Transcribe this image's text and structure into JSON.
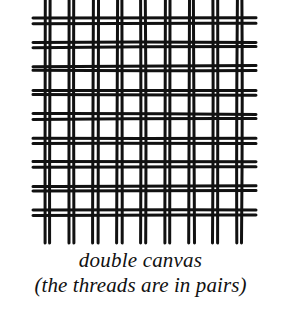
{
  "figure": {
    "name": "double-canvas-weave",
    "alt_description": "Line drawing of a plain-weave canvas in which both warp and weft threads run in pairs",
    "background_color": "#ffffff",
    "thread_color": "#111111",
    "weave": {
      "type": "plain-weave",
      "thread_grouping": "pairs",
      "warp_pair_count": 9,
      "weft_pair_count": 9,
      "pair_gap_px": 2,
      "stroke_width_px": 3,
      "pair_pitch_px": 24,
      "grid_left_px": 45,
      "grid_top_px": 18,
      "grid_right_px": 248,
      "grid_bottom_px": 224,
      "warp_overhang_top_px": 18,
      "warp_overhang_bottom_px": 19,
      "weft_overhang_left_px": 12,
      "weft_overhang_right_px": 8
    }
  },
  "caption": {
    "line_1": "double canvas",
    "line_2": "(the threads are in pairs)"
  }
}
